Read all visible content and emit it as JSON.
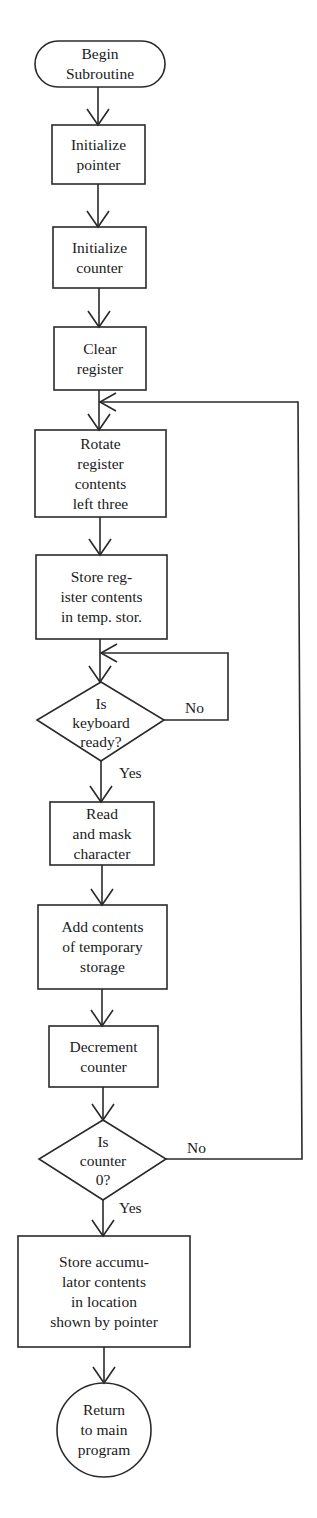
{
  "diagram": {
    "type": "flowchart",
    "colors": {
      "stroke": "#2a2a2a",
      "background": "#ffffff",
      "text": "#1a1a1a"
    },
    "nodes": [
      {
        "id": "begin",
        "shape": "terminal",
        "label": "Begin\nSubroutine"
      },
      {
        "id": "init_pointer",
        "shape": "process",
        "label": "Initialize\npointer"
      },
      {
        "id": "init_counter",
        "shape": "process",
        "label": "Initialize\ncounter"
      },
      {
        "id": "clear_register",
        "shape": "process",
        "label": "Clear\nregister"
      },
      {
        "id": "rotate_register",
        "shape": "process",
        "label": "Rotate\nregister\ncontents\nleft three"
      },
      {
        "id": "store_register",
        "shape": "process",
        "label": "Store reg-\nister contents\nin temp. stor."
      },
      {
        "id": "keyboard_ready",
        "shape": "decision",
        "label": "Is\nkeyboard\nready?"
      },
      {
        "id": "read_mask",
        "shape": "process",
        "label": "Read\nand mask\ncharacter"
      },
      {
        "id": "add_contents",
        "shape": "process",
        "label": "Add contents\nof temporary\nstorage"
      },
      {
        "id": "decrement_counter",
        "shape": "process",
        "label": "Decrement\ncounter"
      },
      {
        "id": "counter_zero",
        "shape": "decision",
        "label": "Is\ncounter\n0?"
      },
      {
        "id": "store_accumulator",
        "shape": "process",
        "label": "Store accumu-\nlator contents\nin location\nshown by pointer"
      },
      {
        "id": "return",
        "shape": "connector",
        "label": "Return\nto main\nprogram"
      }
    ],
    "edge_labels": {
      "keyboard_no": "No",
      "keyboard_yes": "Yes",
      "counter_no": "No",
      "counter_yes": "Yes"
    },
    "edges": [
      {
        "from": "begin",
        "to": "init_pointer"
      },
      {
        "from": "init_pointer",
        "to": "init_counter"
      },
      {
        "from": "init_counter",
        "to": "clear_register"
      },
      {
        "from": "clear_register",
        "to": "rotate_register"
      },
      {
        "from": "rotate_register",
        "to": "store_register"
      },
      {
        "from": "store_register",
        "to": "keyboard_ready"
      },
      {
        "from": "keyboard_ready",
        "to": "keyboard_ready",
        "label": "No"
      },
      {
        "from": "keyboard_ready",
        "to": "read_mask",
        "label": "Yes"
      },
      {
        "from": "read_mask",
        "to": "add_contents"
      },
      {
        "from": "add_contents",
        "to": "decrement_counter"
      },
      {
        "from": "decrement_counter",
        "to": "counter_zero"
      },
      {
        "from": "counter_zero",
        "to": "rotate_register",
        "label": "No"
      },
      {
        "from": "counter_zero",
        "to": "store_accumulator",
        "label": "Yes"
      },
      {
        "from": "store_accumulator",
        "to": "return"
      }
    ]
  }
}
